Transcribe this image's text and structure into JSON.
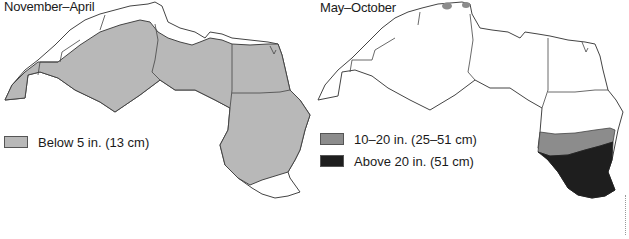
{
  "figure": {
    "panels": [
      {
        "title": "November–April",
        "legend": [
          {
            "label": "Below 5 in. (13 cm)",
            "color": "#b8b8b8"
          }
        ]
      },
      {
        "title": "May–October",
        "legend": [
          {
            "label": "10–20 in. (25–51 cm)",
            "color": "#8c8c8c"
          },
          {
            "label": "Above 20 in. (51 cm)",
            "color": "#1e1e1e"
          }
        ]
      }
    ]
  },
  "colors": {
    "land": "#ffffff",
    "border": "#444444",
    "light_gray": "#b8b8b8",
    "mid_gray": "#8c8c8c",
    "dark": "#1e1e1e"
  }
}
